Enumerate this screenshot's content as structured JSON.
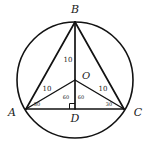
{
  "figure": {
    "background_color": "#ffffff",
    "stroke_color": "#121212",
    "vertices": {
      "B": {
        "label": "B",
        "x": 75,
        "y": 22,
        "label_x": 75,
        "label_y": 13
      },
      "A": {
        "label": "A",
        "x": 26,
        "y": 109,
        "label_x": 12,
        "label_y": 116
      },
      "C": {
        "label": "C",
        "x": 124,
        "y": 109,
        "label_x": 138,
        "label_y": 116
      },
      "D": {
        "label": "D",
        "x": 75,
        "y": 109,
        "label_x": 75,
        "label_y": 121
      },
      "O": {
        "label": "O",
        "x": 75,
        "y": 80,
        "label_x": 82,
        "label_y": 79
      }
    },
    "circle": {
      "center_x": 75,
      "center_y": 80,
      "radius": 58
    },
    "length_labels": [
      {
        "text": "10",
        "x": 68,
        "y": 62,
        "segment": "BO"
      },
      {
        "text": "10",
        "x": 47,
        "y": 91,
        "segment": "AO"
      },
      {
        "text": "10",
        "x": 103,
        "y": 91,
        "segment": "OC"
      }
    ],
    "angle_labels": [
      {
        "text": "60",
        "x": 66,
        "y": 99,
        "vertex": "O",
        "angle": "AOD"
      },
      {
        "text": "60",
        "x": 81,
        "y": 99,
        "vertex": "O",
        "angle": "DOC"
      },
      {
        "text": "30",
        "x": 37,
        "y": 106,
        "vertex": "A",
        "angle": "OAD"
      },
      {
        "text": "30",
        "x": 109,
        "y": 106,
        "vertex": "C",
        "angle": "OCD"
      }
    ],
    "right_angle": {
      "at": "D",
      "x": 75,
      "y": 109,
      "size": 5
    }
  }
}
